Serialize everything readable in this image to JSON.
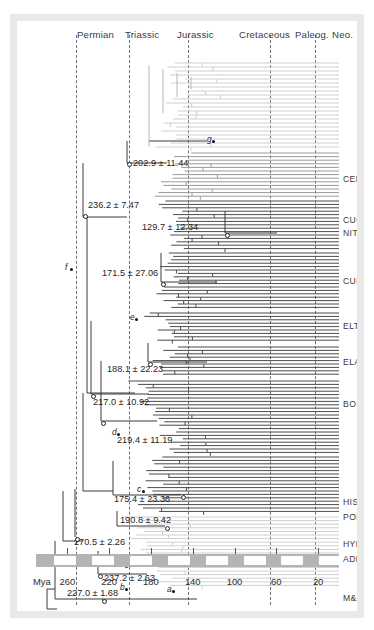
{
  "figure": {
    "type": "phylogenetic-time-tree",
    "axis_unit": "Mya"
  },
  "periods": [
    {
      "name": "Permian",
      "label_x": 60,
      "start_mya": 298,
      "end_mya": 252
    },
    {
      "name": "Triassic",
      "label_x": 108,
      "start_mya": 252,
      "end_mya": 201
    },
    {
      "name": "Jurassic",
      "label_x": 160,
      "start_mya": 201,
      "end_mya": 145
    },
    {
      "name": "Cretaceous",
      "label_x": 222,
      "start_mya": 145,
      "end_mya": 66
    },
    {
      "name": "Paleog.",
      "label_x": 278,
      "start_mya": 66,
      "end_mya": 23
    },
    {
      "name": "Neo.",
      "label_x": 315,
      "start_mya": 23,
      "end_mya": 0
    }
  ],
  "period_boundaries_mya": [
    252,
    201,
    145,
    66,
    23
  ],
  "axis": {
    "label": "Mya",
    "ticks": [
      260,
      220,
      180,
      140,
      100,
      60,
      20
    ],
    "min_mya": 0,
    "max_mya": 290
  },
  "clades": [
    {
      "code": "CER",
      "y": 158
    },
    {
      "code": "CUC",
      "y": 199
    },
    {
      "code": "NIT",
      "y": 212
    },
    {
      "code": "CUR",
      "y": 260
    },
    {
      "code": "ELT",
      "y": 305
    },
    {
      "code": "ELA",
      "y": 341
    },
    {
      "code": "BOS",
      "y": 383
    },
    {
      "code": "HIS",
      "y": 481
    },
    {
      "code": "POL",
      "y": 496
    },
    {
      "code": "HYD",
      "y": 523
    },
    {
      "code": "ADE",
      "y": 538
    },
    {
      "code": "M&A",
      "y": 577
    }
  ],
  "node_ages": [
    {
      "id": "n1",
      "text": "202.9 ± 11.44",
      "mean": 202.9,
      "sd": 11.44,
      "x": 116,
      "y": 143,
      "marker": "circle",
      "marker_x": 110,
      "marker_y": 141
    },
    {
      "id": "n2",
      "text": "236.2 ± 7.47",
      "mean": 236.2,
      "sd": 7.47,
      "x": 71,
      "y": 185,
      "marker": "circle",
      "marker_x": 66,
      "marker_y": 193
    },
    {
      "id": "n3",
      "text": "129.7 ± 12.34",
      "mean": 129.7,
      "sd": 12.34,
      "x": 125,
      "y": 207,
      "marker": "circle",
      "marker_x": 208,
      "marker_y": 212
    },
    {
      "id": "n4",
      "text": "171.5 ± 27.06",
      "mean": 171.5,
      "sd": 27.06,
      "x": 85,
      "y": 253,
      "marker": "circle",
      "marker_x": 144,
      "marker_y": 261
    },
    {
      "id": "n5",
      "text": "188.1 ± 22.23",
      "mean": 188.1,
      "sd": 22.23,
      "x": 90,
      "y": 349,
      "marker": "circle",
      "marker_x": 131,
      "marker_y": 341
    },
    {
      "id": "n6",
      "text": "217.0 ± 10.92",
      "mean": 217.0,
      "sd": 10.92,
      "x": 76,
      "y": 382,
      "marker": "circle",
      "marker_x": 74,
      "marker_y": 373
    },
    {
      "id": "n7",
      "text": "219.4 ± 11.19",
      "mean": 219.4,
      "sd": 11.19,
      "x": 100,
      "y": 420,
      "marker": "circle",
      "marker_x": 84,
      "marker_y": 400
    },
    {
      "id": "n8",
      "text": "175.4 ± 23.36",
      "mean": 175.4,
      "sd": 23.36,
      "x": 97,
      "y": 479,
      "marker": "circle",
      "marker_x": 164,
      "marker_y": 474
    },
    {
      "id": "n9",
      "text": "190.8 ± 9.42",
      "mean": 190.8,
      "sd": 9.42,
      "x": 103,
      "y": 500,
      "marker": "circle",
      "marker_x": 148,
      "marker_y": 505
    },
    {
      "id": "n10",
      "text": "270.5 ± 2.26",
      "mean": 270.5,
      "sd": 2.26,
      "x": 57,
      "y": 522,
      "marker": "circle",
      "marker_x": 58,
      "marker_y": 516
    },
    {
      "id": "n11",
      "text": "219.8 ± 3.89",
      "mean": 219.8,
      "sd": 3.89,
      "x": 113,
      "y": 541,
      "marker": "circle",
      "marker_x": 107,
      "marker_y": 542
    },
    {
      "id": "n12",
      "text": "237.2 ± 2.63",
      "mean": 237.2,
      "sd": 2.63,
      "x": 87,
      "y": 558,
      "marker": "circle",
      "marker_x": 81,
      "marker_y": 553
    },
    {
      "id": "n13",
      "text": "227.0 ± 1.68",
      "mean": 227.0,
      "sd": 1.68,
      "x": 50,
      "y": 573,
      "marker": "circle",
      "marker_x": 85,
      "marker_y": 578
    }
  ],
  "node_letters": [
    {
      "letter": "g",
      "x": 190,
      "y": 118
    },
    {
      "letter": "f",
      "x": 48,
      "y": 246
    },
    {
      "letter": "e",
      "x": 113,
      "y": 296
    },
    {
      "letter": "d",
      "x": 95,
      "y": 411
    },
    {
      "letter": "c",
      "x": 120,
      "y": 468
    },
    {
      "letter": "b",
      "x": 103,
      "y": 566
    },
    {
      "letter": "a",
      "x": 150,
      "y": 568
    }
  ],
  "colors": {
    "frame": "#e9e9e9",
    "background": "#ffffff",
    "gridline": "#6f6f6f",
    "axis_bar": "#b4b4b4",
    "axis_segment": "#ffffff",
    "text": "#2e2e2e",
    "tree_light": "#c9c9c9",
    "tree_dark": "#555555",
    "tree_mid": "#8a8a8a"
  }
}
